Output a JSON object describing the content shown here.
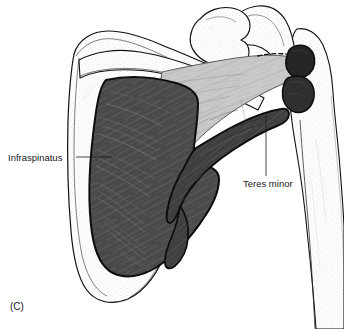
{
  "figure": {
    "panel_label": "(C)",
    "background_color": "#ffffff",
    "view": "posterior view of right scapula and humerus",
    "labels": [
      {
        "id": "infraspinatus",
        "text": "Infraspinatus",
        "text_x": 8,
        "text_y": 161,
        "anchor": "start",
        "leader": "M 76,157 L 112,157",
        "target_structure": "infraspinatus-muscle"
      },
      {
        "id": "teres-minor",
        "text": "Teres minor",
        "text_x": 243,
        "text_y": 187,
        "anchor": "start",
        "leader": "M 266,176 L 266,115",
        "target_structure": "teres-minor-muscle"
      }
    ],
    "structures": [
      {
        "id": "scapula",
        "name": "scapula",
        "fill": "#fbfbfb",
        "stroke": "#111111",
        "tone": "bone-stippled"
      },
      {
        "id": "humerus",
        "name": "humerus",
        "fill": "#fbfbfb",
        "stroke": "#111111",
        "tone": "bone-stippled"
      },
      {
        "id": "clavicle-acromion",
        "name": "acromion-and-coracoid",
        "fill": "#fbfbfb",
        "stroke": "#111111",
        "tone": "bone-stippled"
      },
      {
        "id": "infraspinatus-muscle",
        "name": "infraspinatus muscle belly",
        "fill": "#4a4a4a",
        "stroke": "#0d0d0d",
        "tone": "dark-gray-striated"
      },
      {
        "id": "teres-minor-muscle",
        "name": "teres minor muscle",
        "fill": "#3f3f3f",
        "stroke": "#0d0d0d",
        "tone": "dark-gray-striated"
      },
      {
        "id": "tendon-aponeurosis",
        "name": "tendon and aponeurosis sheet",
        "fill": "#c9c9c9",
        "stroke": "#5a5a5a",
        "tone": "light-gray-striated"
      },
      {
        "id": "insertion-facet-upper",
        "name": "upper greater tuberosity insertion facet",
        "fill": "#262626",
        "stroke": "#0d0d0d",
        "tone": "near-black"
      },
      {
        "id": "insertion-facet-lower",
        "name": "lower greater tuberosity insertion facet",
        "fill": "#333333",
        "stroke": "#0d0d0d",
        "tone": "near-black"
      }
    ],
    "colors": {
      "bone": "#fbfbfb",
      "muscle_dark": "#4a4a4a",
      "tendon_light": "#c9c9c9",
      "insertion_black": "#262626",
      "outline": "#111111",
      "text": "#1a1a1a"
    }
  }
}
